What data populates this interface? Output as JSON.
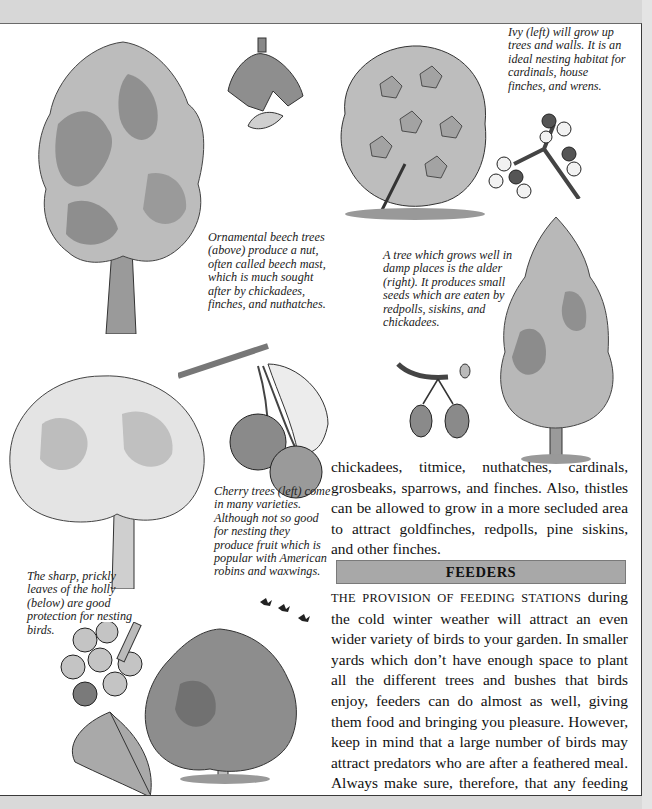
{
  "captions": {
    "ivy": "Ivy (left) will grow up trees and walls. It is an ideal nesting habitat for cardinals, house finches, and wrens.",
    "beech": "Ornamental beech trees (above) produce a nut, often called beech mast, which is much sought after by chickadees, finches, and nuthatches.",
    "alder": "A tree which grows well in damp places is the alder (right). It produces small seeds which are eaten by redpolls, siskins, and chickadees.",
    "cherry": "Cherry trees (left) come in many varieties. Although not so good for nesting they produce fruit which is popular with American robins and waxwings.",
    "holly": "The sharp, prickly leaves of the holly (below) are good protection for nesting birds."
  },
  "intro_paragraph": "chickadees, titmice, nuthatches, cardinals, grosbeaks, sparrows, and finches. Also, thistles can be allowed to grow in a more secluded area to attract goldfinches, redpolls, pine siskins, and other finches.",
  "section": {
    "title": "FEEDERS",
    "lead_in": "THE PROVISION OF FEEDING STATIONS",
    "body": " during the cold winter weather will attract an even wider variety of birds to your garden. In smaller yards which don’t have enough space to plant all the different trees and bushes that birds enjoy, feeders can do almost as well, giving them food and bringing you pleasure. However, keep in mind that a large number of birds may attract predators who are after a feathered meal. Always make sure, therefore, that any feeding area has some safe cover nearby that birds can fly to for protection. Ideally, feeding stations should be situated out in the open where any birds can see a potential enemy approaching. If it is too close to a bush, a cat might hide there. But the garden itself away from the feeder should be planted with dense bushes and shrubs, especially"
  },
  "illustrations": [
    {
      "id": "beech-tree",
      "label": "beech tree illustration"
    },
    {
      "id": "beech-nut",
      "label": "beech nut husk illustration"
    },
    {
      "id": "ivy",
      "label": "ivy bush illustration"
    },
    {
      "id": "ivy-berries",
      "label": "ivy berries illustration"
    },
    {
      "id": "alder-tree",
      "label": "alder tree illustration"
    },
    {
      "id": "alder-cones",
      "label": "alder cones illustration"
    },
    {
      "id": "cherry-tree",
      "label": "cherry tree illustration"
    },
    {
      "id": "cherries",
      "label": "cherries on branch illustration"
    },
    {
      "id": "holly-sprig",
      "label": "holly leaf and berries illustration"
    },
    {
      "id": "holly-tree",
      "label": "holly tree illustration"
    },
    {
      "id": "birds-flying",
      "label": "flying birds illustration"
    }
  ],
  "colors": {
    "page_bg": "#ffffff",
    "frame_bg": "#d9d9d9",
    "header_bar": "#a8a8a8",
    "foliage_light": "#b9b9b9",
    "foliage_dark": "#555555"
  }
}
